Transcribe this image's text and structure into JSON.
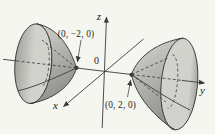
{
  "figure": {
    "type": "hyperboloid-of-two-sheets-diagram",
    "background": "#f6f6f1",
    "ink": "#3a3a3a",
    "text_color": "#1c1c1c",
    "labels": {
      "z_axis": "z",
      "y_axis": "y",
      "x_axis": "x",
      "origin": "0",
      "left_vertex_point": "(0, −2, 0)",
      "right_vertex_point": "(0, 2, 0)"
    },
    "surface_colors": {
      "light": "#d8d8d3",
      "mid": "#b7b7b2",
      "dark": "#92928d",
      "mouth_light": "#d2d2cd",
      "mouth_dark": "#a4a49f"
    }
  }
}
